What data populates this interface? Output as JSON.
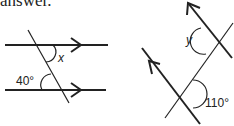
{
  "caption": "answer.",
  "diagram_left": {
    "angle_known": "40°",
    "angle_unknown": "x",
    "description": "Two parallel horizontal lines cut by a transversal"
  },
  "diagram_right": {
    "angle_known": "110°",
    "angle_unknown": "y",
    "description": "Two parallel diagonal lines cut by a transversal"
  },
  "colors": {
    "line": "#222222",
    "background": "#ffffff"
  }
}
